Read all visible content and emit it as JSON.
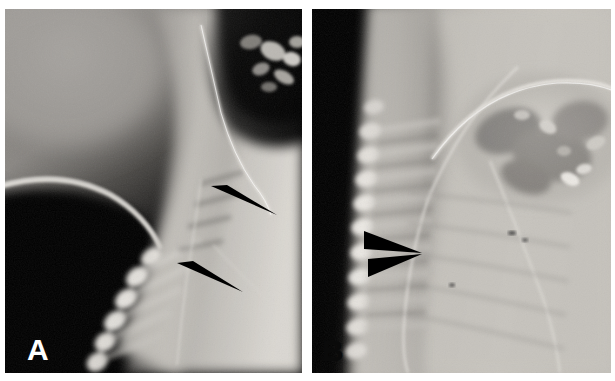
{
  "figure": {
    "type": "radiograph-figure",
    "kind": "two-panel lateral spine radiograph",
    "panel_count": 2,
    "background_color": "#ffffff"
  },
  "panels": [
    {
      "id": "A",
      "label": "A",
      "label_color": "#ffffff",
      "label_position": "bottom-left",
      "description": "Lateral radiograph of the cervicothoracic region",
      "markers": [
        {
          "name": "arrowhead-upper",
          "type": "solid-triangle-arrowhead",
          "color": "#000000",
          "points_direction": "right-down",
          "tip_x": 272,
          "tip_y": 206
        },
        {
          "name": "arrowhead-lower",
          "type": "solid-triangle-arrowhead",
          "color": "#000000",
          "points_direction": "right-down",
          "tip_x": 238,
          "tip_y": 283
        }
      ]
    },
    {
      "id": "B",
      "label": "B",
      "label_color": "#0a0a0a",
      "label_position": "bottom-left",
      "description": "Lateral radiograph of the cervicothoracic region, second view",
      "markers": [
        {
          "name": "arrowhead-pair-upper",
          "type": "solid-triangle-arrowhead",
          "color": "#000000",
          "points_direction": "right-down",
          "tip_x": 420,
          "tip_y": 244
        },
        {
          "name": "arrowhead-pair-lower",
          "type": "solid-triangle-arrowhead",
          "color": "#000000",
          "points_direction": "right-up",
          "tip_x": 420,
          "tip_y": 244
        }
      ]
    }
  ],
  "colors": {
    "film_black": "#000000",
    "bone_white": "#f2f0ec",
    "soft_tissue_gray": "#8d8a86",
    "marker_black": "#000000",
    "page_white": "#ffffff"
  }
}
